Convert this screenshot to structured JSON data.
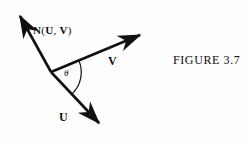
{
  "figure": {
    "caption": "FIGURE 3.7",
    "background_color": "#fdfdfd",
    "ink_color": "#101010",
    "width": 249,
    "height": 144
  },
  "labels": {
    "normal_vector": "N(U, V)",
    "normal_vector_parts": {
      "bold_n": "N",
      "open_paren": "(",
      "bold_u": "U",
      "comma": ", ",
      "bold_v": "V",
      "close_paren": ")"
    },
    "vector_v": "V",
    "vector_u": "U",
    "angle": "θ"
  },
  "geometry": {
    "vertex": {
      "x": 51,
      "y": 72
    },
    "vectors": [
      {
        "name": "N(U, V)",
        "from": {
          "x": 51,
          "y": 72
        },
        "to": {
          "x": 17,
          "y": 11
        },
        "arrow": "tip",
        "label_anchor": {
          "x": 33,
          "y": 24
        }
      },
      {
        "name": "V",
        "from": {
          "x": 51,
          "y": 72
        },
        "to": {
          "x": 146,
          "y": 32
        },
        "arrow": "tip",
        "label_anchor": {
          "x": 108,
          "y": 54
        }
      },
      {
        "name": "U",
        "from": {
          "x": 51,
          "y": 72
        },
        "to": {
          "x": 105,
          "y": 129
        },
        "arrow": "tip",
        "label_anchor": {
          "x": 59,
          "y": 110
        }
      }
    ],
    "angle_arc": {
      "label": "θ",
      "center": {
        "x": 51,
        "y": 72
      },
      "radius": 30,
      "between": [
        "V",
        "U"
      ]
    }
  }
}
